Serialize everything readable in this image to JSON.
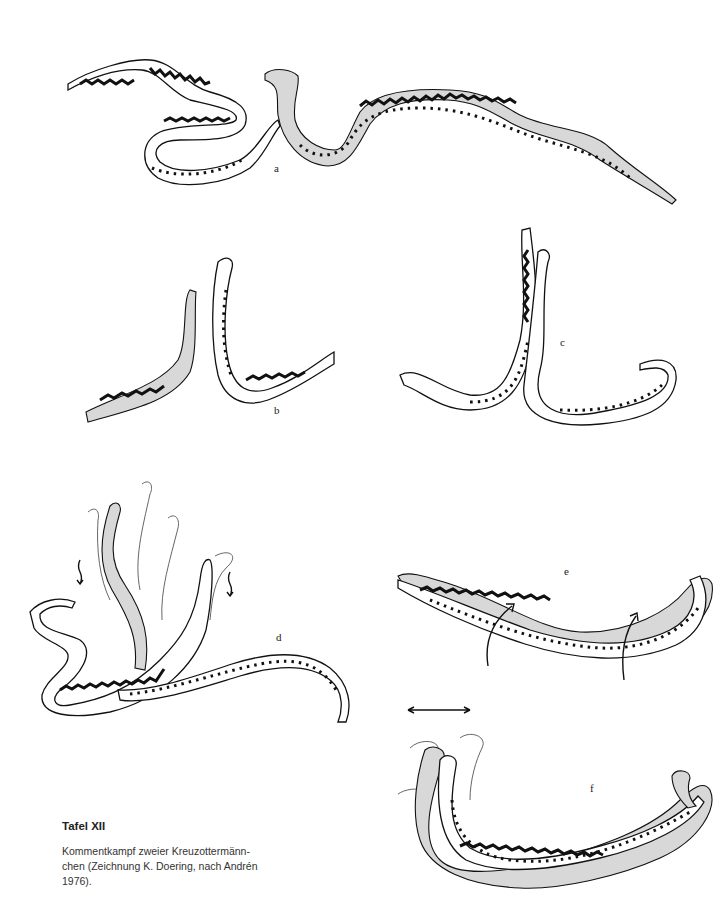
{
  "plate": {
    "panels": [
      {
        "id": "a",
        "label": "a",
        "description": "Two male adders facing each other, one coiled with raised head, one with raised forebody"
      },
      {
        "id": "b",
        "label": "b",
        "description": "Two adders rearing up side by side"
      },
      {
        "id": "c",
        "label": "c",
        "description": "Two adders intertwined with raised heads"
      },
      {
        "id": "d",
        "label": "d",
        "description": "Intertwined adders with motion traces and downward arrows"
      },
      {
        "id": "e",
        "label": "e",
        "description": "Adders entwined with rotation arrows"
      },
      {
        "id": "f",
        "label": "f",
        "description": "Adders entwined pushing heads, with double-headed horizontal arrow"
      }
    ]
  },
  "caption": {
    "title": "Tafel XII",
    "text_line1": "Kommentkampf zweier Kreuzottermänn-",
    "text_line2": "chen (Zeichnung K. Doering, nach Andrén",
    "text_line3": "1976)."
  }
}
